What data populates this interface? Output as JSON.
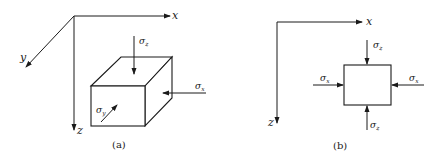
{
  "figure": {
    "panels": [
      {
        "id": "a",
        "caption": "(a)",
        "description": "3D element under triaxial stress",
        "axes": {
          "x": "x",
          "y": "y",
          "z": "z"
        },
        "stresses": [
          {
            "symbol": "σ",
            "subscript": "z",
            "direction": "down onto top face"
          },
          {
            "symbol": "σ",
            "subscript": "x",
            "direction": "leftward onto right face"
          },
          {
            "symbol": "σ",
            "subscript": "y",
            "direction": "into front face"
          }
        ]
      },
      {
        "id": "b",
        "caption": "(b)",
        "description": "2D element in x-z plane",
        "axes": {
          "x": "x",
          "z": "z"
        },
        "stresses": [
          {
            "symbol": "σ",
            "subscript": "z",
            "position": "top"
          },
          {
            "symbol": "σ",
            "subscript": "x",
            "position": "left"
          },
          {
            "symbol": "σ",
            "subscript": "x",
            "position": "right"
          },
          {
            "symbol": "σ",
            "subscript": "z",
            "position": "bottom"
          }
        ]
      }
    ]
  },
  "labels": {
    "sigma": "σ",
    "x": "x",
    "y": "y",
    "z": "z",
    "caption_a": "(a)",
    "caption_b": "(b)"
  }
}
